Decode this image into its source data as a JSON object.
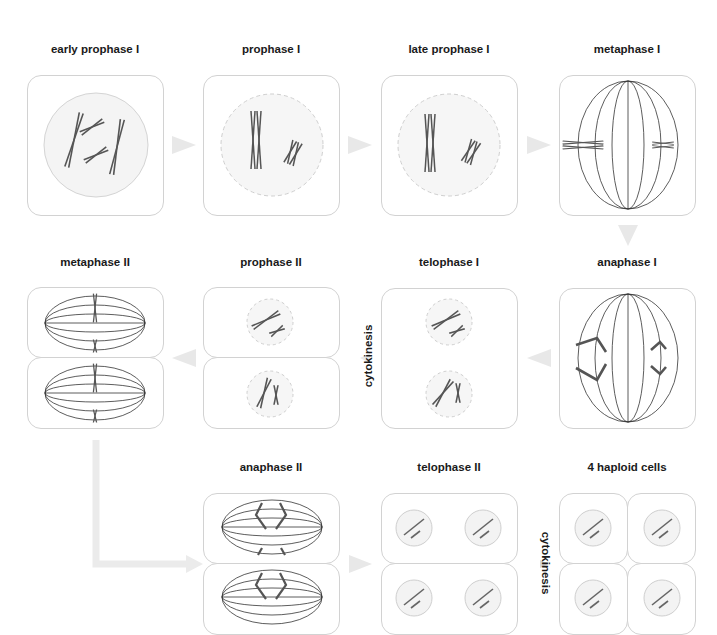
{
  "diagram": {
    "type": "meiosis-stages-flow",
    "stages": [
      {
        "id": "early-prophase-1",
        "label": "early prophase I",
        "row": 1,
        "col": 1
      },
      {
        "id": "prophase-1",
        "label": "prophase I",
        "row": 1,
        "col": 2
      },
      {
        "id": "late-prophase-1",
        "label": "late prophase I",
        "row": 1,
        "col": 3
      },
      {
        "id": "metaphase-1",
        "label": "metaphase I",
        "row": 1,
        "col": 4
      },
      {
        "id": "anaphase-1",
        "label": "anaphase I",
        "row": 2,
        "col": 4
      },
      {
        "id": "telophase-1",
        "label": "telophase I",
        "row": 2,
        "col": 3
      },
      {
        "id": "prophase-2",
        "label": "prophase II",
        "row": 2,
        "col": 2
      },
      {
        "id": "metaphase-2",
        "label": "metaphase II",
        "row": 2,
        "col": 1
      },
      {
        "id": "anaphase-2",
        "label": "anaphase II",
        "row": 3,
        "col": 2
      },
      {
        "id": "telophase-2",
        "label": "telophase II",
        "row": 3,
        "col": 3
      },
      {
        "id": "haploid-cells",
        "label": "4 haploid cells",
        "row": 3,
        "col": 4
      }
    ],
    "annotations": {
      "cytokinesis_1": "cytokinesis",
      "cytokinesis_2": "cytokinesis"
    },
    "flow": [
      "early prophase I → prophase I",
      "prophase I → late prophase I",
      "late prophase I → metaphase I",
      "metaphase I → anaphase I",
      "anaphase I → telophase I",
      "telophase I → prophase II (cytokinesis)",
      "prophase II → metaphase II",
      "metaphase II → anaphase II",
      "anaphase II → telophase II",
      "telophase II → 4 haploid cells (cytokinesis)"
    ],
    "colors": {
      "panel_border": "#d2d2d2",
      "arrow": "#e6e6e6",
      "chromosome": "#555555",
      "spindle": "#333333",
      "nucleus_fill": "#f3f3f3",
      "nucleus_border": "#cfcfcf"
    }
  }
}
